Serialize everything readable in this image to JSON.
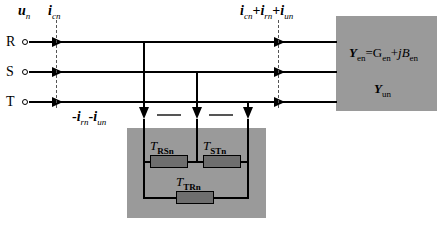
{
  "figure": {
    "type": "electrical-circuit-diagram",
    "background": "#ffffff",
    "gray_fill": "#9a9a9a",
    "resistor_fill": "#6e6e6e",
    "line_color": "#000000"
  },
  "terminals": [
    {
      "id": "R",
      "label": "R",
      "y": 42
    },
    {
      "id": "S",
      "label": "S",
      "y": 72
    },
    {
      "id": "T",
      "label": "T",
      "y": 102
    }
  ],
  "labels": {
    "voltage": {
      "symbol": "u",
      "sub": "n",
      "text": "u n"
    },
    "current_c": {
      "symbol": "i",
      "sub": "cn",
      "text": "i cn"
    },
    "current_sum": {
      "text": "i cn + i rn + i un",
      "parts": [
        "i",
        "cn",
        "+",
        "i",
        "rn",
        "+",
        "i",
        "un"
      ]
    },
    "current_neg": {
      "text": "- i rn - i un",
      "parts": [
        "-",
        "i",
        "rn",
        "-",
        "i",
        "un"
      ]
    }
  },
  "admittance_block": {
    "equation": {
      "lhs": "Y",
      "lhs_sub": "en",
      "eq": "=",
      "g": "G",
      "g_sub": "en",
      "plus": "+",
      "jb": "jB",
      "jb_sub": "en",
      "full_text": "Y_en = G_en + jB_en"
    },
    "second": {
      "symbol": "Y",
      "sub": "un",
      "full_text": "Y_un"
    }
  },
  "transformer_block": {
    "elements": [
      {
        "id": "t-rs",
        "symbol": "T",
        "sub": "RSn",
        "full_text": "T_RSn"
      },
      {
        "id": "t-st",
        "symbol": "T",
        "sub": "STn",
        "full_text": "T_STn"
      },
      {
        "id": "t-tr",
        "symbol": "T",
        "sub": "TRn",
        "full_text": "T_TRn"
      }
    ]
  }
}
